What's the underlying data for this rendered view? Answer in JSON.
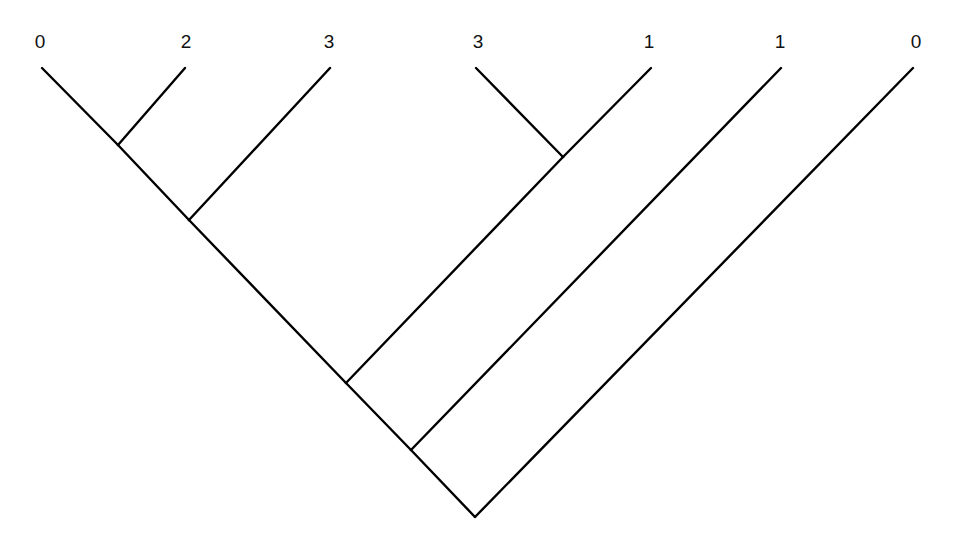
{
  "diagram": {
    "type": "cladogram",
    "line_color": "#000000",
    "label_color": "#111111",
    "background": "#ffffff",
    "leaves": [
      {
        "label": "0",
        "x": 42,
        "y": 68
      },
      {
        "label": "2",
        "x": 185,
        "y": 68
      },
      {
        "label": "3",
        "x": 330,
        "y": 68
      },
      {
        "label": "3",
        "x": 476,
        "y": 68
      },
      {
        "label": "1",
        "x": 651,
        "y": 68
      },
      {
        "label": "1",
        "x": 781,
        "y": 68
      },
      {
        "label": "0",
        "x": 913,
        "y": 68
      }
    ],
    "internal_nodes": [
      {
        "id": "A",
        "x": 118,
        "y": 145,
        "children": [
          "leaf0",
          "leaf1"
        ]
      },
      {
        "id": "B",
        "x": 189,
        "y": 220,
        "children": [
          "A",
          "leaf2"
        ]
      },
      {
        "id": "C",
        "x": 563,
        "y": 157,
        "children": [
          "leaf3",
          "leaf4"
        ]
      },
      {
        "id": "D",
        "x": 346,
        "y": 383,
        "children": [
          "B",
          "C"
        ]
      },
      {
        "id": "E",
        "x": 411,
        "y": 450,
        "children": [
          "D",
          "leaf5"
        ]
      },
      {
        "id": "root",
        "x": 475,
        "y": 517,
        "children": [
          "E",
          "leaf6"
        ]
      }
    ],
    "edges": [
      {
        "from": "leaf0",
        "x1": 42,
        "y1": 68,
        "x2": 118,
        "y2": 145
      },
      {
        "from": "leaf1",
        "x1": 185,
        "y1": 68,
        "x2": 118,
        "y2": 145
      },
      {
        "from": "A",
        "x1": 118,
        "y1": 145,
        "x2": 189,
        "y2": 220
      },
      {
        "from": "leaf2",
        "x1": 330,
        "y1": 68,
        "x2": 189,
        "y2": 220
      },
      {
        "from": "leaf3",
        "x1": 476,
        "y1": 68,
        "x2": 563,
        "y2": 157
      },
      {
        "from": "leaf4",
        "x1": 651,
        "y1": 68,
        "x2": 563,
        "y2": 157
      },
      {
        "from": "B",
        "x1": 189,
        "y1": 220,
        "x2": 346,
        "y2": 383
      },
      {
        "from": "C",
        "x1": 563,
        "y1": 157,
        "x2": 346,
        "y2": 383
      },
      {
        "from": "D",
        "x1": 346,
        "y1": 383,
        "x2": 411,
        "y2": 450
      },
      {
        "from": "leaf5",
        "x1": 781,
        "y1": 68,
        "x2": 411,
        "y2": 450
      },
      {
        "from": "E",
        "x1": 411,
        "y1": 450,
        "x2": 475,
        "y2": 517
      },
      {
        "from": "leaf6",
        "x1": 913,
        "y1": 68,
        "x2": 475,
        "y2": 517
      }
    ]
  }
}
